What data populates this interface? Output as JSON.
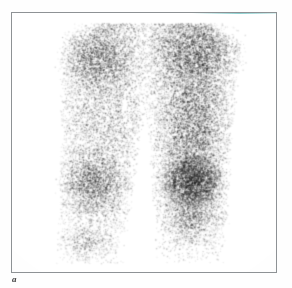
{
  "figure": {
    "panel_label": "a",
    "modality_caption": "",
    "frame": {
      "border_color": "#8e9295",
      "background_color": "#ffffff",
      "left": 11,
      "top": 12,
      "width": 266,
      "height": 261,
      "top_edge_tint_color": "#78c8c8"
    }
  },
  "scan": {
    "type": "nuclear-medicine-bone-scintigram",
    "view": "anterior",
    "region": "bilateral lower extremities",
    "background_color": "#ffffff",
    "tracer_color": "#1a1a1a",
    "grain_seed": 20240711,
    "grain_point_count": 52000,
    "legs": [
      {
        "name": "left-leg",
        "side_label": "",
        "axis_top_x": 98,
        "axis_bottom_x": 78,
        "top_y": 10,
        "bottom_y": 250,
        "top_half_width": 52,
        "mid_half_width": 40,
        "bottom_half_width": 34,
        "base_intensity": 0.62,
        "hotspots": [
          {
            "cx": 84,
            "cy": 46,
            "rx": 34,
            "ry": 30,
            "strength": 0.55
          },
          {
            "cx": 80,
            "cy": 170,
            "rx": 30,
            "ry": 26,
            "strength": 0.48
          },
          {
            "cx": 74,
            "cy": 232,
            "rx": 24,
            "ry": 16,
            "strength": 0.3
          }
        ]
      },
      {
        "name": "right-leg",
        "side_label": "",
        "axis_top_x": 178,
        "axis_bottom_x": 178,
        "top_y": 10,
        "bottom_y": 250,
        "top_half_width": 54,
        "mid_half_width": 42,
        "bottom_half_width": 34,
        "base_intensity": 0.74,
        "hotspots": [
          {
            "cx": 186,
            "cy": 40,
            "rx": 40,
            "ry": 30,
            "strength": 0.62
          },
          {
            "cx": 182,
            "cy": 112,
            "rx": 26,
            "ry": 46,
            "strength": 0.52
          },
          {
            "cx": 180,
            "cy": 168,
            "rx": 26,
            "ry": 21,
            "strength": 1.0
          },
          {
            "cx": 180,
            "cy": 205,
            "rx": 26,
            "ry": 22,
            "strength": 0.35
          }
        ]
      }
    ],
    "findings": {
      "focal_intense_uptake": "right proximal tibia / knee region",
      "diffuse_uptake": "bilateral femoral and tibial shafts"
    }
  }
}
